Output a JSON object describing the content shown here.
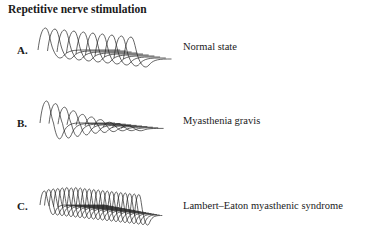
{
  "title": "Repetitive nerve stimulation",
  "panels": [
    {
      "letter": "A.",
      "condition": "Normal state",
      "trace": {
        "count": 10,
        "x0": 38,
        "baseline": 50,
        "dx": 9.5,
        "dy": 1.0,
        "amplitudes": [
          22,
          22,
          22,
          22,
          22,
          22,
          22,
          22,
          22,
          22
        ],
        "neg_depth": 10,
        "width": 34
      }
    },
    {
      "letter": "B.",
      "condition": "Myasthenia gravis",
      "trace": {
        "count": 10,
        "x0": 40,
        "baseline": 123,
        "dx": 9.0,
        "dy": 0.6,
        "amplitudes": [
          22,
          20,
          17,
          14,
          11,
          9,
          7,
          5,
          4,
          3
        ],
        "neg_depth_first": 22,
        "width": 30
      }
    },
    {
      "letter": "C.",
      "condition": "Lambert–Eaton myasthenic syndrome",
      "trace": {
        "count": 22,
        "x0": 40,
        "baseline": 205,
        "dx": 4.5,
        "dy": 0.5,
        "amplitudes": [
          14,
          16,
          17,
          18,
          19,
          20,
          20,
          21,
          21,
          21,
          21,
          21,
          21,
          21,
          21,
          21,
          21,
          21,
          21,
          21,
          21,
          21
        ],
        "neg_depth": 12,
        "width": 20
      }
    }
  ]
}
